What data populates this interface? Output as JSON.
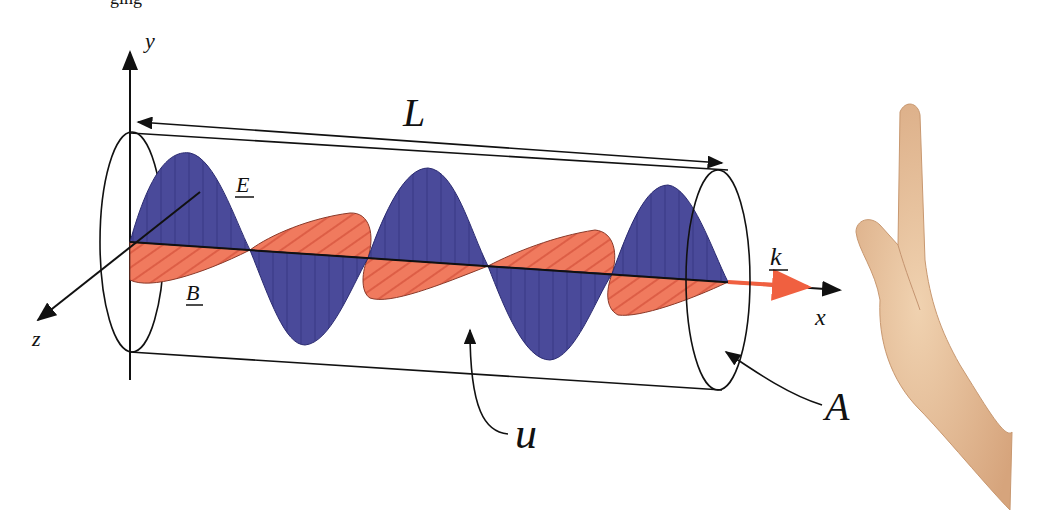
{
  "diagram": {
    "labels": {
      "y_axis": "y",
      "x_axis": "x",
      "z_axis": "z",
      "length": "L",
      "electric_field": "E",
      "magnetic_field": "B",
      "wave_vector": "k",
      "area": "A",
      "energy_density": "u"
    },
    "colors": {
      "electric_field": "#4a4a9a",
      "magnetic_field": "#f07a5e",
      "wave_vector_arrow": "#f06040",
      "outline": "#111111",
      "skin": "#e0b48c"
    },
    "top_fragment": "ging"
  }
}
